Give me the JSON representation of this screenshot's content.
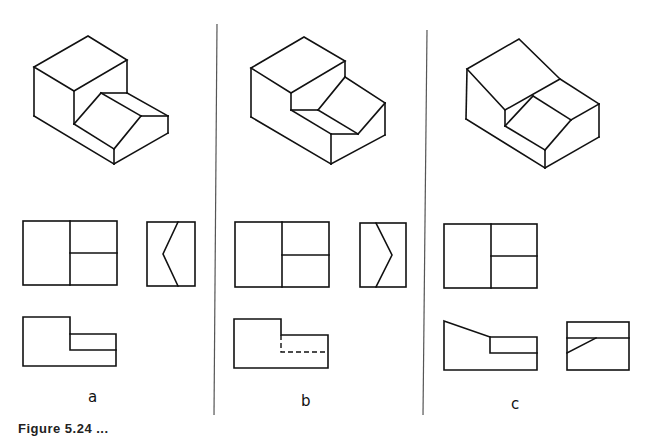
{
  "figure": {
    "panels": [
      {
        "id": "a",
        "label": "a",
        "has_side_view": true,
        "front_hidden_line": "solid"
      },
      {
        "id": "b",
        "label": "b",
        "has_side_view": true,
        "front_hidden_line": "dashed"
      },
      {
        "id": "c",
        "label": "c",
        "has_side_view": true,
        "front_hidden_line": "solid"
      }
    ],
    "caption": "Figure 5.24  ..."
  },
  "colors": {
    "line": "#111111",
    "divider": "#555555",
    "background": "#ffffff"
  }
}
